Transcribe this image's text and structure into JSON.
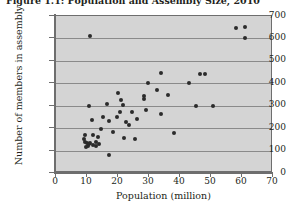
{
  "figure": {
    "title": "Figure 1.1: Population and Assembly Size, 2010"
  },
  "chart_data": {
    "type": "scatter",
    "title": "Figure 1.1: Population and Assembly Size, 2010",
    "xlabel": "Population (million)",
    "ylabel": "Number of members in assembly",
    "xlim": [
      0,
      70
    ],
    "ylim": [
      0,
      700
    ],
    "xticks": [
      0,
      10,
      20,
      30,
      40,
      50,
      60,
      70
    ],
    "yticks": [
      0,
      100,
      200,
      300,
      400,
      500,
      600,
      700
    ],
    "grid": "horizontal",
    "legend": "none",
    "marker": "filled-diamond",
    "marker_color": "#2b2b2b",
    "plot_background": "#d4d4d4",
    "points": [
      {
        "x": 11.0,
        "y": 613
      },
      {
        "x": 58.0,
        "y": 645
      },
      {
        "x": 61.0,
        "y": 650
      },
      {
        "x": 61.0,
        "y": 600
      },
      {
        "x": 34.0,
        "y": 447
      },
      {
        "x": 46.5,
        "y": 443
      },
      {
        "x": 48.0,
        "y": 443
      },
      {
        "x": 43.0,
        "y": 403
      },
      {
        "x": 29.5,
        "y": 400
      },
      {
        "x": 32.5,
        "y": 370
      },
      {
        "x": 20.0,
        "y": 358
      },
      {
        "x": 36.0,
        "y": 350
      },
      {
        "x": 28.5,
        "y": 345
      },
      {
        "x": 28.5,
        "y": 330
      },
      {
        "x": 21.0,
        "y": 325
      },
      {
        "x": 16.5,
        "y": 307
      },
      {
        "x": 21.5,
        "y": 305
      },
      {
        "x": 10.5,
        "y": 300
      },
      {
        "x": 45.0,
        "y": 300
      },
      {
        "x": 50.5,
        "y": 300
      },
      {
        "x": 29.0,
        "y": 280
      },
      {
        "x": 20.5,
        "y": 270
      },
      {
        "x": 24.5,
        "y": 270
      },
      {
        "x": 34.0,
        "y": 262
      },
      {
        "x": 15.0,
        "y": 250
      },
      {
        "x": 19.5,
        "y": 248
      },
      {
        "x": 26.0,
        "y": 243
      },
      {
        "x": 11.5,
        "y": 238
      },
      {
        "x": 17.0,
        "y": 233
      },
      {
        "x": 22.5,
        "y": 228
      },
      {
        "x": 23.5,
        "y": 215
      },
      {
        "x": 14.5,
        "y": 198
      },
      {
        "x": 18.5,
        "y": 185
      },
      {
        "x": 38.0,
        "y": 180
      },
      {
        "x": 9.5,
        "y": 170
      },
      {
        "x": 12.0,
        "y": 168
      },
      {
        "x": 13.5,
        "y": 160
      },
      {
        "x": 22.0,
        "y": 155
      },
      {
        "x": 25.5,
        "y": 152
      },
      {
        "x": 9.0,
        "y": 150
      },
      {
        "x": 9.5,
        "y": 140
      },
      {
        "x": 10.0,
        "y": 135
      },
      {
        "x": 10.5,
        "y": 128
      },
      {
        "x": 11.0,
        "y": 133
      },
      {
        "x": 10.2,
        "y": 122
      },
      {
        "x": 11.8,
        "y": 125
      },
      {
        "x": 9.8,
        "y": 118
      },
      {
        "x": 12.8,
        "y": 140
      },
      {
        "x": 13.0,
        "y": 122
      },
      {
        "x": 14.0,
        "y": 128
      },
      {
        "x": 17.0,
        "y": 80
      }
    ]
  }
}
